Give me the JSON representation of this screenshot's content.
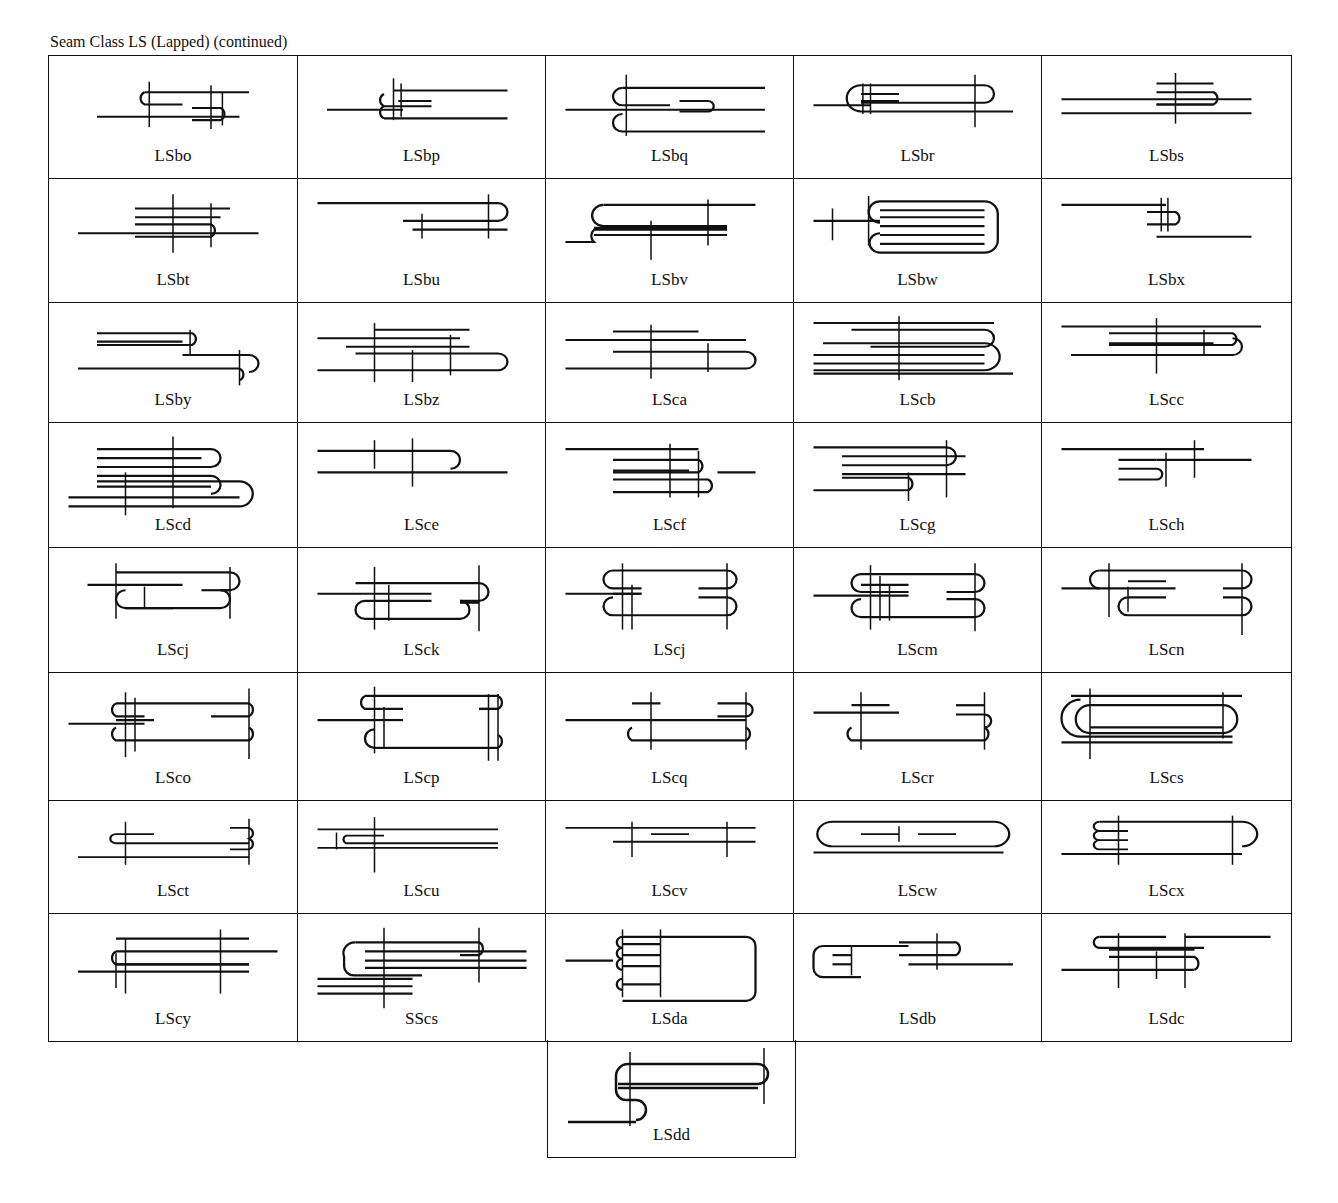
{
  "title": "Seam Class LS (Lapped) (continued)",
  "row_heights": [
    123,
    124,
    120,
    125,
    125,
    128,
    113,
    127
  ],
  "cells": [
    {
      "label": "LSbo",
      "icon": "seam-diagram-icon"
    },
    {
      "label": "LSbp",
      "icon": "seam-diagram-icon"
    },
    {
      "label": "LSbq",
      "icon": "seam-diagram-icon"
    },
    {
      "label": "LSbr",
      "icon": "seam-diagram-icon"
    },
    {
      "label": "LSbs",
      "icon": "seam-diagram-icon"
    },
    {
      "label": "LSbt",
      "icon": "seam-diagram-icon"
    },
    {
      "label": "LSbu",
      "icon": "seam-diagram-icon"
    },
    {
      "label": "LSbv",
      "icon": "seam-diagram-icon"
    },
    {
      "label": "LSbw",
      "icon": "seam-diagram-icon"
    },
    {
      "label": "LSbx",
      "icon": "seam-diagram-icon"
    },
    {
      "label": "LSby",
      "icon": "seam-diagram-icon"
    },
    {
      "label": "LSbz",
      "icon": "seam-diagram-icon"
    },
    {
      "label": "LSca",
      "icon": "seam-diagram-icon"
    },
    {
      "label": "LScb",
      "icon": "seam-diagram-icon"
    },
    {
      "label": "LScc",
      "icon": "seam-diagram-icon"
    },
    {
      "label": "LScd",
      "icon": "seam-diagram-icon"
    },
    {
      "label": "LSce",
      "icon": "seam-diagram-icon"
    },
    {
      "label": "LScf",
      "icon": "seam-diagram-icon"
    },
    {
      "label": "LScg",
      "icon": "seam-diagram-icon"
    },
    {
      "label": "LSch",
      "icon": "seam-diagram-icon"
    },
    {
      "label": "LScj",
      "icon": "seam-diagram-icon"
    },
    {
      "label": "LSck",
      "icon": "seam-diagram-icon"
    },
    {
      "label": "LScj",
      "icon": "seam-diagram-icon"
    },
    {
      "label": "LScm",
      "icon": "seam-diagram-icon"
    },
    {
      "label": "LScn",
      "icon": "seam-diagram-icon"
    },
    {
      "label": "LSco",
      "icon": "seam-diagram-icon"
    },
    {
      "label": "LScp",
      "icon": "seam-diagram-icon"
    },
    {
      "label": "LScq",
      "icon": "seam-diagram-icon"
    },
    {
      "label": "LScr",
      "icon": "seam-diagram-icon"
    },
    {
      "label": "LScs",
      "icon": "seam-diagram-icon"
    },
    {
      "label": "LSct",
      "icon": "seam-diagram-icon"
    },
    {
      "label": "LScu",
      "icon": "seam-diagram-icon"
    },
    {
      "label": "LScv",
      "icon": "seam-diagram-icon"
    },
    {
      "label": "LScw",
      "icon": "seam-diagram-icon"
    },
    {
      "label": "LScx",
      "icon": "seam-diagram-icon"
    },
    {
      "label": "LScy",
      "icon": "seam-diagram-icon"
    },
    {
      "label": "SScs",
      "icon": "seam-diagram-icon"
    },
    {
      "label": "LSda",
      "icon": "seam-diagram-icon"
    },
    {
      "label": "LSdb",
      "icon": "seam-diagram-icon"
    },
    {
      "label": "LSdc",
      "icon": "seam-diagram-icon"
    }
  ],
  "extra_cell": {
    "label": "LSdd",
    "icon": "seam-diagram-icon"
  }
}
